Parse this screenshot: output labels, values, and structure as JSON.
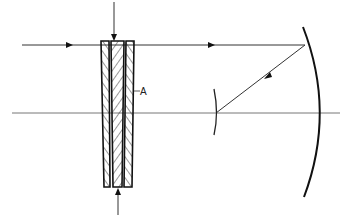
{
  "diagram": {
    "type": "optical-schematic",
    "labels": {
      "corrector": "A"
    },
    "colors": {
      "stroke": "#1a1a1a",
      "axis": "#777777",
      "ray": "#333333",
      "background": "#ffffff"
    },
    "elements": [
      {
        "id": "optical-axis",
        "kind": "line",
        "from": [
          12,
          113
        ],
        "to": [
          340,
          113
        ]
      },
      {
        "id": "incoming-ray",
        "kind": "ray",
        "from": [
          22,
          45
        ],
        "to": [
          305,
          45
        ],
        "arrows": [
          [
            70,
            45
          ],
          [
            212,
            45
          ]
        ]
      },
      {
        "id": "reflected-ray",
        "kind": "ray",
        "from": [
          305,
          45
        ],
        "to": [
          216,
          113
        ],
        "arrows": [
          [
            266,
            78
          ]
        ]
      },
      {
        "id": "corrector-plate-A",
        "kind": "wedge-plate-stack",
        "plates": 3,
        "top": 41,
        "bottom": 187,
        "x": [
          101,
          135
        ]
      },
      {
        "id": "top-arrow",
        "kind": "arrow",
        "from": [
          114,
          2
        ],
        "to": [
          114,
          40
        ]
      },
      {
        "id": "bottom-arrow",
        "kind": "arrow",
        "from": [
          118,
          215
        ],
        "to": [
          118,
          188
        ]
      },
      {
        "id": "primary-mirror",
        "kind": "arc",
        "top": [
          303,
          27
        ],
        "mid": [
          320,
          113
        ],
        "bottom": [
          304,
          197
        ]
      },
      {
        "id": "secondary-mirror",
        "kind": "arc",
        "top": [
          215,
          90
        ],
        "mid": [
          216,
          113
        ],
        "bottom": [
          215,
          134
        ]
      }
    ]
  }
}
